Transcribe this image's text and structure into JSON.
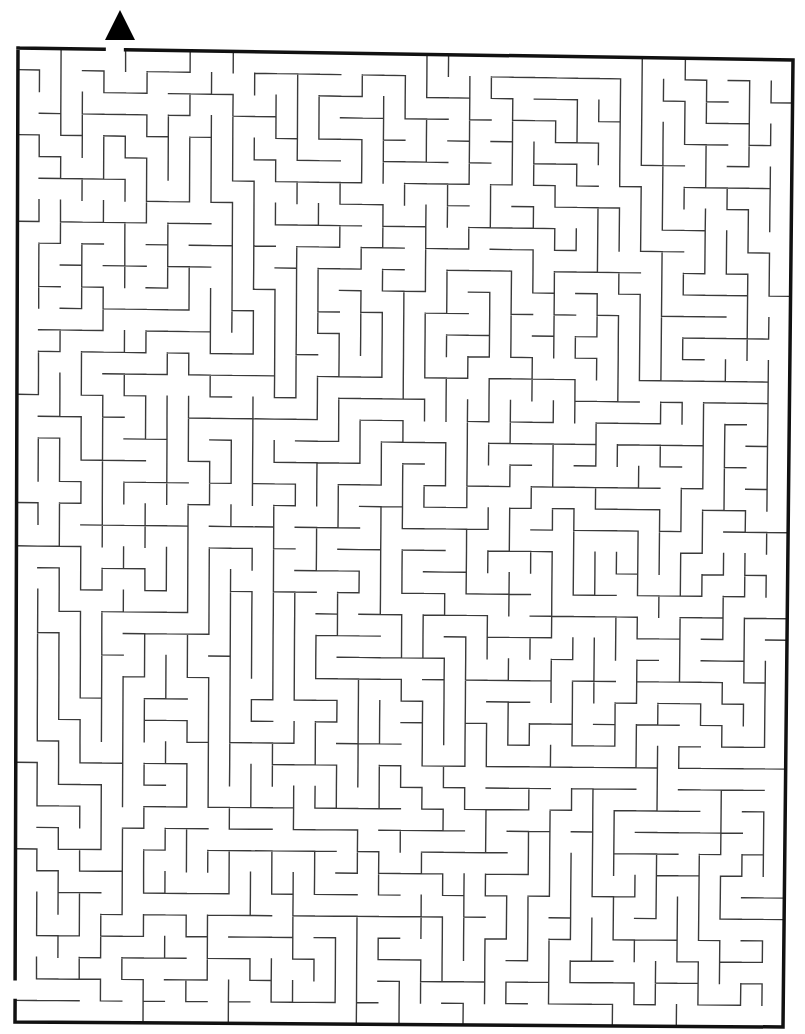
{
  "canvas": {
    "width": 805,
    "height": 1034,
    "background": "#ffffff"
  },
  "colors": {
    "border": "#111111",
    "walls": "#3a3a3a",
    "marker": "#000000"
  },
  "border": {
    "stroke_width": 3.5,
    "corners": {
      "top_left": [
        18,
        48
      ],
      "top_right": [
        793,
        60
      ],
      "bottom_right": [
        783,
        1027
      ],
      "bottom_left": [
        15,
        1022
      ]
    }
  },
  "grid": {
    "cols": 36,
    "rows": 45,
    "wall_width": 1.4,
    "seed": 20240611
  },
  "entry": {
    "side": "top",
    "col": 4,
    "gap_x": [
      108,
      130
    ],
    "marker": "triangle-up",
    "marker_points": [
      [
        105,
        40
      ],
      [
        120,
        10
      ],
      [
        135,
        40
      ]
    ]
  },
  "exit": {
    "side": "left",
    "row": 43,
    "gap_y": [
      973,
      995
    ]
  }
}
